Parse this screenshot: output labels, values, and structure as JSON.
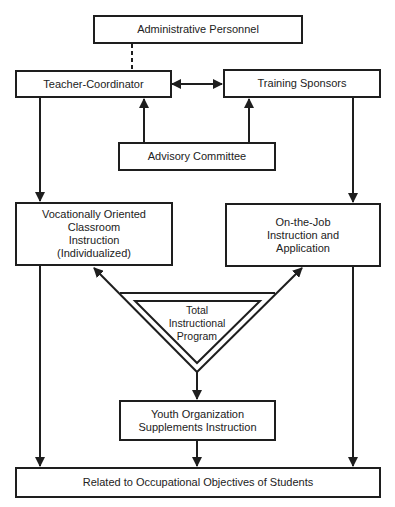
{
  "diagram": {
    "nodes": {
      "admin": {
        "label": "Administrative Personnel"
      },
      "teacher": {
        "label": "Teacher-Coordinator"
      },
      "sponsors": {
        "label": "Training Sponsors"
      },
      "advisory": {
        "label": "Advisory Committee"
      },
      "classroom": {
        "lines": [
          "Vocationally Oriented",
          "Classroom",
          "Instruction",
          "(Individualized)"
        ]
      },
      "ojt": {
        "lines": [
          "On-the-Job",
          "Instruction and",
          "Application"
        ]
      },
      "total": {
        "lines": [
          "Total",
          "Instructional",
          "Program"
        ]
      },
      "youth": {
        "lines": [
          "Youth Organization",
          "Supplements Instruction"
        ]
      },
      "objectives": {
        "label": "Related to Occupational Objectives of Students"
      }
    },
    "edges": [
      {
        "from": "admin",
        "to": "teacher",
        "style": "dashed"
      },
      {
        "from": "teacher",
        "to": "sponsors",
        "style": "bidirectional"
      },
      {
        "from": "advisory",
        "to": "teacher",
        "style": "arrow"
      },
      {
        "from": "advisory",
        "to": "sponsors",
        "style": "arrow"
      },
      {
        "from": "teacher",
        "to": "classroom",
        "style": "arrow"
      },
      {
        "from": "sponsors",
        "to": "ojt",
        "style": "arrow"
      },
      {
        "from": "total",
        "to": "classroom",
        "style": "arrow"
      },
      {
        "from": "total",
        "to": "ojt",
        "style": "arrow"
      },
      {
        "from": "total",
        "to": "youth",
        "style": "arrow"
      },
      {
        "from": "classroom",
        "to": "objectives",
        "style": "arrow"
      },
      {
        "from": "youth",
        "to": "objectives",
        "style": "arrow"
      },
      {
        "from": "ojt",
        "to": "objectives",
        "style": "arrow"
      }
    ],
    "colors": {
      "line": "#1e1e1e",
      "background": "#ffffff"
    }
  }
}
